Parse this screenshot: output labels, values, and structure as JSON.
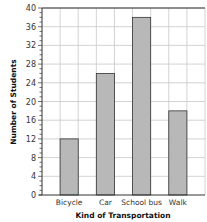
{
  "chart_data": {
    "type": "bar",
    "title": "",
    "xlabel": "Kind of Transportation",
    "ylabel": "Number of Students",
    "categories": [
      "Bicycle",
      "Car",
      "School bus",
      "Walk"
    ],
    "values": [
      12,
      26,
      38,
      18
    ],
    "ylim": [
      0,
      40
    ],
    "yticks": [
      0,
      4,
      8,
      12,
      16,
      20,
      24,
      28,
      32,
      36,
      40
    ],
    "grid": true,
    "legend": "none",
    "colors": {
      "bar": "#b8b8b8",
      "bar_edge": "#333333",
      "grid": "#c8c8c8",
      "axis": "#333333"
    }
  }
}
